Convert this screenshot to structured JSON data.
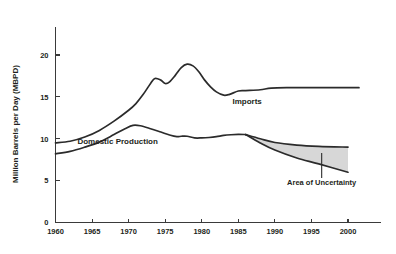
{
  "chart_data": {
    "type": "line",
    "title": "",
    "xlabel": "",
    "ylabel": "Million Barrels per Day (MBPD)",
    "xlim": [
      1958,
      2003
    ],
    "ylim": [
      0,
      23
    ],
    "xticks": [
      "1960",
      "1965",
      "1970",
      "1975",
      "1980",
      "1985",
      "1990",
      "1995",
      "2000"
    ],
    "xtick_values": [
      1960,
      1965,
      1970,
      1975,
      1980,
      1985,
      1990,
      1995,
      2000
    ],
    "yticks": [
      "0",
      "5",
      "10",
      "15",
      "20"
    ],
    "ytick_values": [
      0,
      5,
      10,
      15,
      20
    ],
    "grid": false,
    "legend_position": "inline-labels",
    "series": [
      {
        "name": "Imports",
        "label": "Imports",
        "label_x": 1986.2,
        "label_y": 14.2,
        "x": [
          1960,
          1962,
          1964,
          1966,
          1968,
          1970,
          1971,
          1972,
          1973,
          1973.6,
          1974.4,
          1975,
          1975.6,
          1976.4,
          1977.2,
          1978,
          1978.8,
          1979.6,
          1980.4,
          1981.2,
          1982,
          1983,
          1983.8,
          1985,
          1986,
          1988,
          1989.5,
          1992,
          1996,
          2000,
          2001.5
        ],
        "values": [
          9.5,
          9.7,
          10.2,
          11.0,
          12.1,
          13.4,
          14.2,
          15.3,
          16.6,
          17.2,
          17.0,
          16.6,
          16.8,
          17.6,
          18.5,
          18.9,
          18.7,
          18.0,
          17.0,
          16.2,
          15.6,
          15.2,
          15.3,
          15.7,
          15.75,
          15.85,
          16.05,
          16.1,
          16.1,
          16.1,
          16.1
        ]
      },
      {
        "name": "Domestic Production",
        "label": "Domestic Production",
        "label_x": 1968.5,
        "label_y": 9.35,
        "x": [
          1960,
          1962,
          1964,
          1966,
          1968,
          1969.5,
          1970.6,
          1971.6,
          1973,
          1974.4,
          1975.6,
          1976.6,
          1977.2,
          1978,
          1979,
          1980,
          1981,
          1982,
          1983,
          1984,
          1985,
          1986
        ],
        "values": [
          8.2,
          8.5,
          9.0,
          9.6,
          10.5,
          11.2,
          11.6,
          11.55,
          11.2,
          10.8,
          10.45,
          10.25,
          10.3,
          10.3,
          10.1,
          10.1,
          10.15,
          10.25,
          10.4,
          10.48,
          10.52,
          10.5
        ]
      },
      {
        "name": "Uncertainty Upper Bound",
        "label": "",
        "x": [
          1986,
          1988,
          1990,
          1993,
          1996,
          2000
        ],
        "values": [
          10.5,
          10.0,
          9.55,
          9.25,
          9.1,
          9.0
        ]
      },
      {
        "name": "Uncertainty Lower Bound",
        "label": "",
        "x": [
          1986,
          1988,
          1990,
          1993,
          1996,
          2000
        ],
        "values": [
          10.5,
          9.5,
          8.65,
          7.7,
          7.0,
          6.0
        ]
      }
    ],
    "annotations": [
      {
        "name": "area-of-uncertainty",
        "text": "Area of Uncertainty",
        "label_x": 1996.4,
        "label_y": 4.45,
        "leader_x": 1996.4,
        "leader_y_top": 8.3,
        "leader_y_bottom": 5.3
      }
    ],
    "colors": {
      "line": "#2b2b2b",
      "axis": "#3a3a3a",
      "uncertainty_fill": "#d7d7d7",
      "text": "#231f20",
      "background": "#ffffff"
    }
  }
}
